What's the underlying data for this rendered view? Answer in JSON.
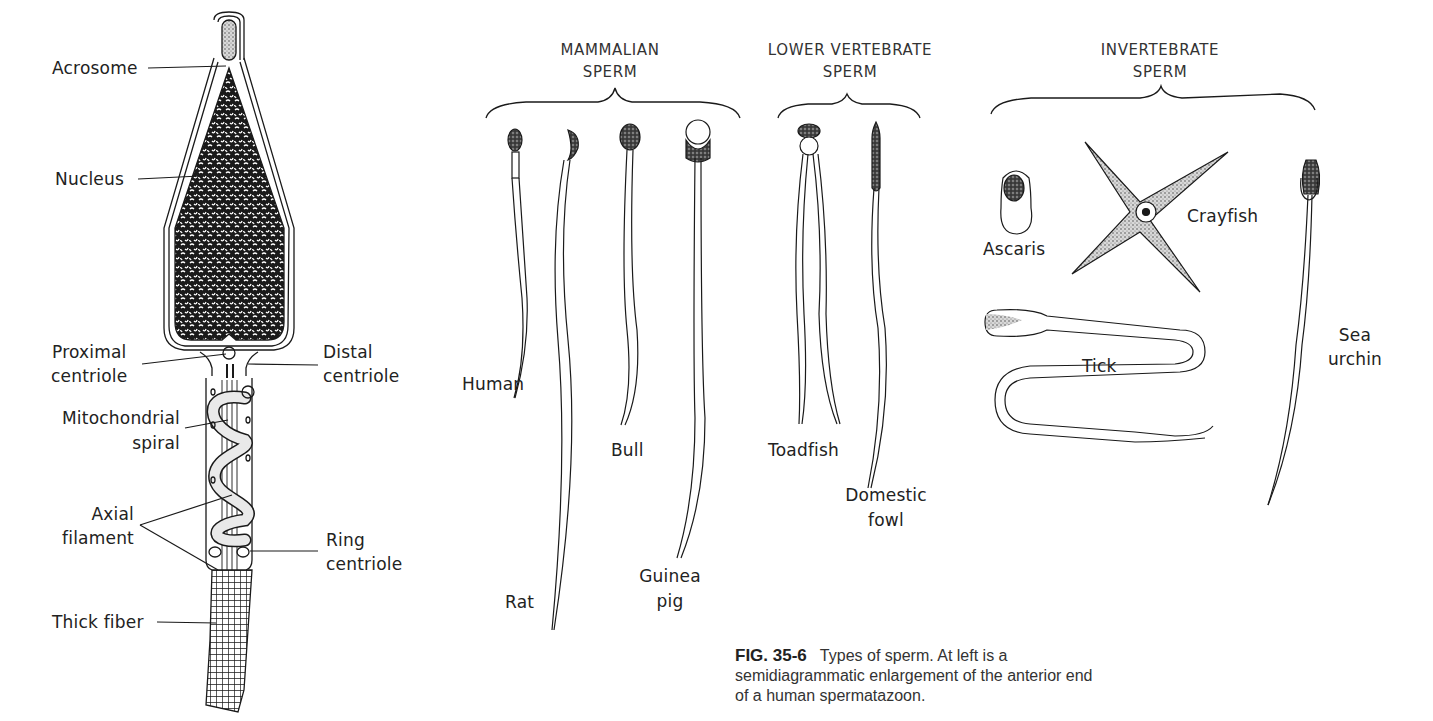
{
  "figure": {
    "number": "FIG. 35-6",
    "caption_line1": "Types of sperm. At left is a",
    "caption_line2": "semidiagrammatic enlargement of the anterior end",
    "caption_line3": "of a human spermatazoon."
  },
  "human_sperm_diagram": {
    "labels": {
      "acrosome": "Acrosome",
      "nucleus": "Nucleus",
      "proximal_centriole_1": "Proximal",
      "proximal_centriole_2": "centriole",
      "distal_centriole_1": "Distal",
      "distal_centriole_2": "centriole",
      "mitochondrial_spiral_1": "Mitochondrial",
      "mitochondrial_spiral_2": "spiral",
      "axial_filament_1": "Axial",
      "axial_filament_2": "filament",
      "ring_centriole_1": "Ring",
      "ring_centriole_2": "centriole",
      "thick_fiber": "Thick fiber"
    }
  },
  "groups": {
    "mammalian": {
      "title_1": "MAMMALIAN",
      "title_2": "SPERM",
      "species": {
        "human": "Human",
        "rat": "Rat",
        "bull": "Bull",
        "guinea_pig_1": "Guinea",
        "guinea_pig_2": "pig"
      }
    },
    "lower_vertebrate": {
      "title_1": "LOWER VERTEBRATE",
      "title_2": "SPERM",
      "species": {
        "toadfish": "Toadfish",
        "domestic_fowl_1": "Domestic",
        "domestic_fowl_2": "fowl"
      }
    },
    "invertebrate": {
      "title_1": "INVERTEBRATE",
      "title_2": "SPERM",
      "species": {
        "ascaris": "Ascaris",
        "crayfish": "Crayfish",
        "tick": "Tick",
        "sea_urchin_1": "Sea",
        "sea_urchin_2": "urchin"
      }
    }
  },
  "colors": {
    "ink": "#1a1a1a",
    "text": "#222222",
    "background": "#ffffff"
  }
}
